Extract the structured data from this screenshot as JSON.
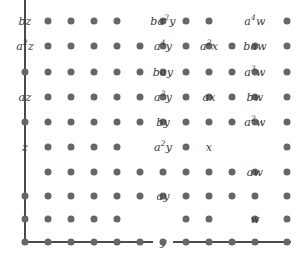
{
  "figure": {
    "name": "monomial-lattice-diagram",
    "width": 298,
    "height": 262,
    "background_color": "#ffffff",
    "dot_color": "#666666",
    "axis_color": "#4a4a4a",
    "text_color": "#3a3a3a"
  },
  "grid": {
    "columns": 12,
    "rows": 10,
    "col_x": [
      25,
      48,
      71,
      94,
      117,
      140,
      163,
      186,
      209,
      232,
      255,
      287
    ],
    "row_y": [
      21,
      46,
      72,
      97,
      122,
      147,
      172,
      196,
      219,
      242
    ],
    "dot_radius": 3.5
  },
  "axes": {
    "vertical": {
      "x": 25,
      "y_top": 0,
      "y_bottom": 242,
      "label": "z"
    },
    "horizontal": {
      "y": 242,
      "x_left": 25,
      "x_right": 298,
      "label": "y"
    },
    "horizontal_label": {
      "text": "y",
      "x": 163,
      "y": 242
    }
  },
  "labels": [
    {
      "text": "bz",
      "sup": "",
      "x": 25,
      "y": 21,
      "anchor_x": 25,
      "anchor_y": 21
    },
    {
      "text": "a",
      "sup": "2",
      "tail": "z",
      "x": 25,
      "y": 46
    },
    {
      "text": "az",
      "sup": "",
      "x": 25,
      "y": 97
    },
    {
      "text": "z",
      "sup": "",
      "x": 25,
      "y": 147
    },
    {
      "text": "ba",
      "sup": "2",
      "tail": "y",
      "x": 163,
      "y": 21
    },
    {
      "text": "a",
      "sup": "4",
      "tail": "y",
      "x": 163,
      "y": 46
    },
    {
      "text": "bay",
      "sup": "",
      "x": 163,
      "y": 72
    },
    {
      "text": "a",
      "sup": "3",
      "tail": "y",
      "x": 163,
      "y": 97
    },
    {
      "text": "by",
      "sup": "",
      "x": 163,
      "y": 122
    },
    {
      "text": "a",
      "sup": "2",
      "tail": "y",
      "x": 163,
      "y": 147
    },
    {
      "text": "ay",
      "sup": "",
      "x": 163,
      "y": 196
    },
    {
      "text": "a",
      "sup": "2",
      "tail": "x",
      "x": 209,
      "y": 46
    },
    {
      "text": "ax",
      "sup": "",
      "x": 209,
      "y": 97
    },
    {
      "text": "x",
      "sup": "",
      "x": 209,
      "y": 147
    },
    {
      "text": "a",
      "sup": "4",
      "tail": "w",
      "x": 255,
      "y": 21
    },
    {
      "text": "baw",
      "sup": "",
      "x": 255,
      "y": 46
    },
    {
      "text": "a",
      "sup": "3",
      "tail": "w",
      "x": 255,
      "y": 72
    },
    {
      "text": "bw",
      "sup": "",
      "x": 255,
      "y": 97
    },
    {
      "text": "a",
      "sup": "2",
      "tail": "w",
      "x": 255,
      "y": 122
    },
    {
      "text": "aw",
      "sup": "",
      "x": 255,
      "y": 172
    },
    {
      "text": "w",
      "sup": "",
      "x": 255,
      "y": 219
    }
  ],
  "dots_hidden": [
    "0,0",
    "1,0",
    "3,0",
    "5,0",
    "6,0",
    "0,5",
    "0,9",
    "0,10",
    "5,5",
    "5,6",
    "5,8",
    "5,9",
    "5,10",
    "8,5",
    "8,6",
    "8,9",
    "10,5",
    "10,6",
    "10,8",
    "10,9",
    "10,10"
  ]
}
